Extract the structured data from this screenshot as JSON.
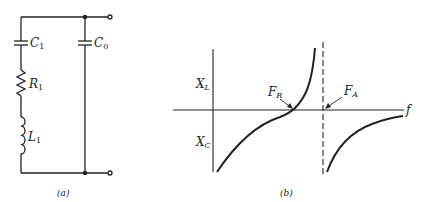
{
  "colors": {
    "ink": "#222222",
    "background": "#ffffff"
  },
  "circuit": {
    "caption": "(a)",
    "components": [
      {
        "id": "C1",
        "type": "capacitor",
        "label": "C",
        "sub": "1"
      },
      {
        "id": "R1",
        "type": "resistor",
        "label": "R",
        "sub": "1"
      },
      {
        "id": "L1",
        "type": "inductor",
        "label": "L",
        "sub": "1"
      },
      {
        "id": "C0",
        "type": "capacitor",
        "label": "C",
        "sub": "0"
      }
    ]
  },
  "graph": {
    "caption": "(b)",
    "x_axis_label": "f",
    "upper_label": {
      "main": "X",
      "sub": "L"
    },
    "lower_label": {
      "main": "X",
      "sub": "C"
    },
    "resonance_label": {
      "main": "F",
      "sub": "R"
    },
    "antiresonance_label": {
      "main": "F",
      "sub": "A"
    }
  }
}
